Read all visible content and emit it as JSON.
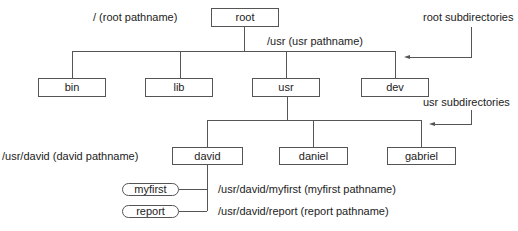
{
  "diagram": {
    "nodes": {
      "root": "root",
      "bin": "bin",
      "lib": "lib",
      "usr": "usr",
      "dev": "dev",
      "david": "david",
      "daniel": "daniel",
      "gabriel": "gabriel",
      "myfirst": "myfirst",
      "report": "report"
    },
    "labels": {
      "root_pathname": "/ (root pathname)",
      "usr_pathname": "/usr (usr pathname)",
      "root_subdirectories": "root subdirectories",
      "usr_subdirectories": "usr subdirectories",
      "david_pathname": "/usr/david (david pathname)",
      "myfirst_pathname": "/usr/david/myfirst (myfirst pathname)",
      "report_pathname": "/usr/david/report (report pathname)"
    },
    "colors": {
      "line": "#555555",
      "text": "#222222",
      "background": "#ffffff"
    }
  }
}
